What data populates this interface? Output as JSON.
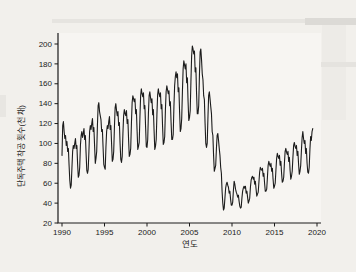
{
  "figure": {
    "background": "#f2f0ec",
    "plot_background": "#f7f5f2",
    "line_color": "#1c1c1c",
    "axis_color": "#1a1a1a",
    "text_color": "#1a1a1a"
  },
  "chart_data": {
    "type": "line",
    "title": "",
    "xlabel": "연도",
    "ylabel": "단독주택 착공 횟수(천 채)",
    "xlim": [
      1989.5,
      2020.5
    ],
    "ylim": [
      20,
      211
    ],
    "x_ticks": [
      1990,
      1995,
      2000,
      2005,
      2010,
      2015,
      2020
    ],
    "y_ticks": [
      20,
      40,
      60,
      80,
      100,
      120,
      140,
      160,
      180,
      200
    ],
    "grid": false,
    "legend": false,
    "x_start_year": 1990,
    "x_step_months": 1,
    "series": [
      {
        "name": "단독주택 착공 횟수",
        "values": [
          88,
          118,
          122,
          112,
          105,
          108,
          98,
          102,
          92,
          95,
          78,
          63,
          55,
          58,
          75,
          92,
          98,
          95,
          100,
          105,
          95,
          98,
          80,
          66,
          68,
          76,
          98,
          108,
          112,
          106,
          110,
          115,
          104,
          108,
          90,
          73,
          70,
          74,
          92,
          112,
          118,
          114,
          120,
          125,
          112,
          116,
          98,
          80,
          85,
          92,
          118,
          138,
          141,
          132,
          128,
          124,
          112,
          114,
          96,
          79,
          76,
          74,
          96,
          112,
          118,
          115,
          122,
          127,
          114,
          118,
          100,
          82,
          84,
          92,
          116,
          136,
          140,
          133,
          128,
          132,
          118,
          121,
          100,
          84,
          81,
          87,
          110,
          128,
          134,
          130,
          128,
          133,
          120,
          124,
          104,
          87,
          89,
          95,
          120,
          141,
          148,
          145,
          142,
          145,
          130,
          134,
          113,
          94,
          97,
          101,
          126,
          148,
          155,
          150,
          147,
          151,
          135,
          138,
          117,
          97,
          96,
          104,
          130,
          148,
          152,
          146,
          141,
          145,
          129,
          134,
          113,
          94,
          97,
          104,
          129,
          149,
          155,
          150,
          147,
          151,
          135,
          139,
          117,
          99,
          101,
          107,
          134,
          152,
          158,
          154,
          150,
          153,
          138,
          142,
          121,
          104,
          104,
          109,
          137,
          158,
          167,
          172,
          166,
          170,
          152,
          156,
          132,
          112,
          115,
          125,
          152,
          175,
          183,
          179,
          175,
          180,
          161,
          166,
          142,
          123,
          126,
          133,
          162,
          188,
          198,
          195,
          190,
          193,
          172,
          176,
          150,
          130,
          130,
          138,
          168,
          192,
          195,
          184,
          170,
          164,
          148,
          144,
          120,
          100,
          96,
          100,
          125,
          148,
          152,
          145,
          137,
          130,
          112,
          108,
          88,
          72,
          75,
          78,
          95,
          108,
          110,
          103,
          95,
          88,
          76,
          70,
          52,
          40,
          33,
          35,
          45,
          55,
          59,
          61,
          58,
          56,
          50,
          52,
          44,
          38,
          38,
          41,
          53,
          62,
          59,
          54,
          51,
          49,
          46,
          48,
          42,
          37,
          35,
          36,
          45,
          52,
          55,
          57,
          55,
          57,
          50,
          52,
          46,
          40,
          42,
          45,
          56,
          63,
          66,
          67,
          64,
          66,
          59,
          62,
          54,
          47,
          49,
          51,
          61,
          71,
          76,
          74,
          73,
          75,
          67,
          70,
          60,
          52,
          52,
          54,
          66,
          78,
          82,
          79,
          77,
          80,
          72,
          75,
          64,
          55,
          57,
          60,
          73,
          85,
          90,
          87,
          85,
          88,
          78,
          82,
          70,
          61,
          62,
          66,
          80,
          92,
          95,
          91,
          89,
          92,
          82,
          86,
          73,
          64,
          67,
          72,
          86,
          98,
          101,
          97,
          95,
          98,
          88,
          92,
          79,
          69,
          72,
          78,
          93,
          106,
          112,
          105,
          100,
          103,
          90,
          95,
          80,
          71,
          70,
          76,
          94,
          107,
          103,
          112,
          115
        ]
      }
    ]
  }
}
